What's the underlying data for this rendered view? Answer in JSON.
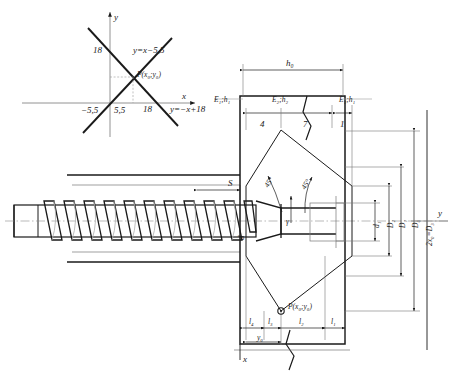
{
  "drawing": {
    "title": "Extruder screw and die head assembly with coordinate inset",
    "inset": {
      "name": "coordinate-plot",
      "axis_x_label": "x",
      "axis_y_label": "y",
      "line1_label": "y=x−5,5",
      "line2_label": "y=−x+18",
      "point_label": "P(x₀;y₀)",
      "ticks": {
        "y_intercept_top": "18",
        "x_negative": "−5,5",
        "x_first": "5,5",
        "x_second": "18"
      }
    },
    "top_dimensions": {
      "overall": "h₀",
      "zone_left": "E₁;h₁",
      "zone_middle": "E₂;h₂",
      "zone_right": "E₁;h₁",
      "segments": [
        "4",
        "7",
        "1"
      ]
    },
    "angles": {
      "left": "45°",
      "right": "45°",
      "gamma": "γ"
    },
    "screw": {
      "pitch_label": "S",
      "core_diameter": "d"
    },
    "right_dimensions": [
      "d₁",
      "D₂",
      "D₁",
      "D₀",
      "2x₀=D₃"
    ],
    "bottom_dimensions": [
      "l₄",
      "l₃",
      "l₂",
      "l₁"
    ],
    "bottom_offset": "y₀",
    "axis_x_label": "x",
    "axis_y_label": "y",
    "point_label": "P(x₀;y₀)",
    "colors": {
      "ink": "#1a1a1a",
      "thin": "#555555",
      "construction": "#8a8a8a",
      "paper": "#ffffff"
    }
  }
}
